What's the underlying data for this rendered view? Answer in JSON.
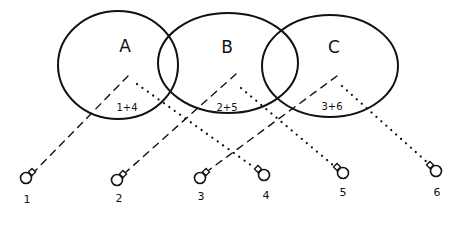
{
  "diagram": {
    "type": "venn-with-connections",
    "sets": [
      {
        "id": "A",
        "label": "A",
        "sum": "1+4",
        "cx": 118,
        "cy": 65,
        "rx": 60,
        "ry": 54,
        "label_pos": [
          125,
          46
        ],
        "sum_pos": [
          127,
          107
        ]
      },
      {
        "id": "B",
        "label": "B",
        "sum": "2+5",
        "cx": 228,
        "cy": 63,
        "rx": 70,
        "ry": 50,
        "label_pos": [
          227,
          47
        ],
        "sum_pos": [
          227,
          107
        ]
      },
      {
        "id": "C",
        "label": "C",
        "sum": "3+6",
        "cx": 330,
        "cy": 66,
        "rx": 68,
        "ry": 51,
        "label_pos": [
          334,
          47
        ],
        "sum_pos": [
          332,
          106
        ]
      }
    ],
    "nodes": [
      {
        "id": "1",
        "label": "1",
        "x": 26,
        "y": 178,
        "label_pos": [
          27,
          199
        ],
        "stem": "right"
      },
      {
        "id": "2",
        "label": "2",
        "x": 117,
        "y": 180,
        "label_pos": [
          119,
          198
        ],
        "stem": "right"
      },
      {
        "id": "3",
        "label": "3",
        "x": 200,
        "y": 178,
        "label_pos": [
          201,
          196
        ],
        "stem": "right"
      },
      {
        "id": "4",
        "label": "4",
        "x": 264,
        "y": 175,
        "label_pos": [
          266,
          195
        ],
        "stem": "left"
      },
      {
        "id": "5",
        "label": "5",
        "x": 343,
        "y": 173,
        "label_pos": [
          343,
          192
        ],
        "stem": "left"
      },
      {
        "id": "6",
        "label": "6",
        "x": 436,
        "y": 171,
        "label_pos": [
          437,
          192
        ],
        "stem": "left"
      }
    ],
    "connections": [
      {
        "from": "A",
        "to": "1",
        "style": "dashed",
        "x1": 128,
        "y1": 76,
        "x2": 34,
        "y2": 172
      },
      {
        "from": "A",
        "to": "4",
        "style": "dotted",
        "x1": 137,
        "y1": 84,
        "x2": 255,
        "y2": 168
      },
      {
        "from": "B",
        "to": "2",
        "style": "dashed",
        "x1": 236,
        "y1": 74,
        "x2": 126,
        "y2": 172
      },
      {
        "from": "B",
        "to": "5",
        "style": "dotted",
        "x1": 241,
        "y1": 88,
        "x2": 333,
        "y2": 165
      },
      {
        "from": "C",
        "to": "3",
        "style": "dashed",
        "x1": 337,
        "y1": 76,
        "x2": 209,
        "y2": 170
      },
      {
        "from": "C",
        "to": "6",
        "style": "dotted",
        "x1": 342,
        "y1": 86,
        "x2": 428,
        "y2": 163
      }
    ],
    "colors": {
      "ink": "#111111",
      "background": "#ffffff"
    }
  }
}
